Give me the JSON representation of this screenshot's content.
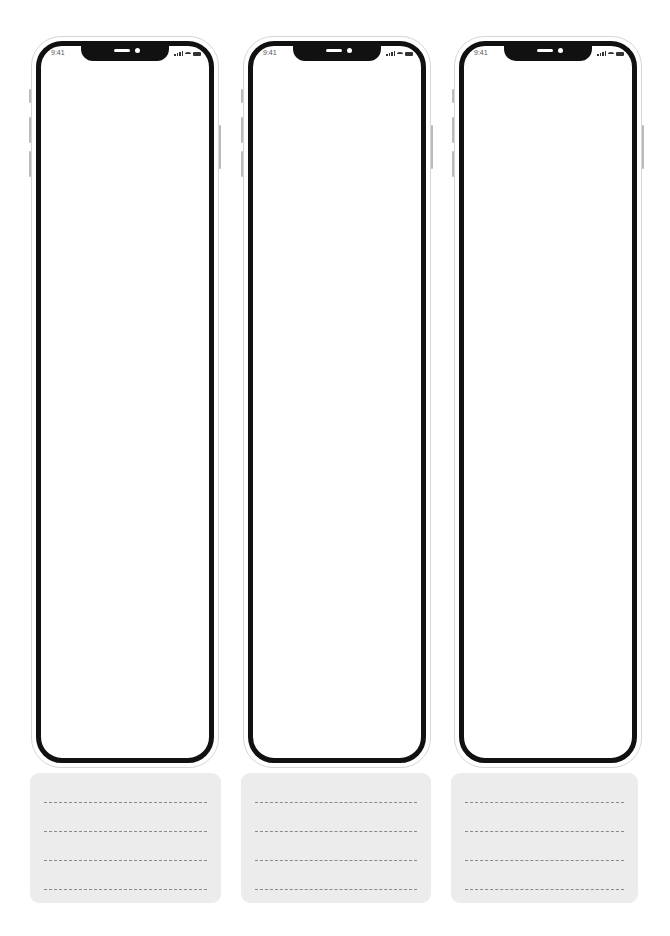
{
  "phones": [
    {
      "status_time": "9:41",
      "signal": "signal-bars-icon",
      "wifi": "wifi-icon",
      "battery": "battery-icon"
    },
    {
      "status_time": "9:41",
      "signal": "signal-bars-icon",
      "wifi": "wifi-icon",
      "battery": "battery-icon"
    },
    {
      "status_time": "9:41",
      "signal": "signal-bars-icon",
      "wifi": "wifi-icon",
      "battery": "battery-icon"
    }
  ],
  "note_cards": [
    {
      "lines": 4
    },
    {
      "lines": 4
    },
    {
      "lines": 4
    }
  ],
  "colors": {
    "bezel": "#111111",
    "frame": "#d6d6d6",
    "card_bg": "#ececec",
    "dash": "#8a8a8a"
  }
}
